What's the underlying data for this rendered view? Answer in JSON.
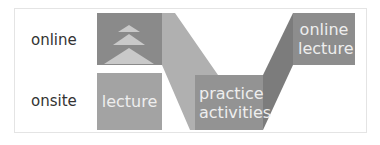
{
  "rows": {
    "online_label": "online",
    "onsite_label": "onsite"
  },
  "boxes": {
    "onsite_lecture": "lecture",
    "practice": "practice activities",
    "online_lecture": "online lecture"
  },
  "colors": {
    "online_block": "#8a8a8a",
    "onsite_block": "#a3a3a3",
    "practice_block": "#939393",
    "online_lecture_block": "#8d8d8d",
    "band_down": "#b0b0b0",
    "band_up": "#7c7c7c",
    "arrows": "#c9c9c9",
    "frame": "#e4e4e4"
  }
}
